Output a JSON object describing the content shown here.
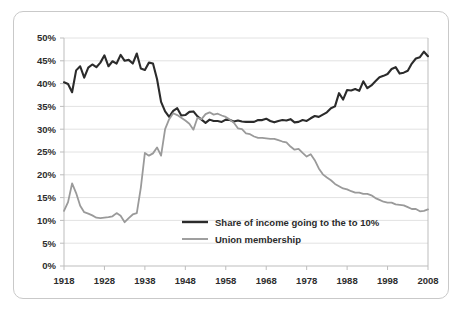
{
  "chart_data": {
    "type": "line",
    "title": "",
    "subtitle": "",
    "xlabel": "",
    "ylabel": "",
    "xlim": [
      1918,
      2008
    ],
    "ylim": [
      0,
      50
    ],
    "grid": true,
    "legend_position": "center",
    "x_ticks": [
      "1918",
      "1928",
      "1938",
      "1948",
      "1958",
      "1968",
      "1978",
      "1988",
      "1998",
      "2008"
    ],
    "x_tick_values": [
      1918,
      1928,
      1938,
      1948,
      1958,
      1968,
      1978,
      1988,
      1998,
      2008
    ],
    "y_ticks": [
      "0%",
      "5%",
      "10%",
      "15%",
      "20%",
      "25%",
      "30%",
      "35%",
      "40%",
      "45%",
      "50%"
    ],
    "y_tick_values": [
      0,
      5,
      10,
      15,
      20,
      25,
      30,
      35,
      40,
      45,
      50
    ],
    "x": [
      1918,
      1919,
      1920,
      1921,
      1922,
      1923,
      1924,
      1925,
      1926,
      1927,
      1928,
      1929,
      1930,
      1931,
      1932,
      1933,
      1934,
      1935,
      1936,
      1937,
      1938,
      1939,
      1940,
      1941,
      1942,
      1943,
      1944,
      1945,
      1946,
      1947,
      1948,
      1949,
      1950,
      1951,
      1952,
      1953,
      1954,
      1955,
      1956,
      1957,
      1958,
      1959,
      1960,
      1961,
      1962,
      1963,
      1964,
      1965,
      1966,
      1967,
      1968,
      1969,
      1970,
      1971,
      1972,
      1973,
      1974,
      1975,
      1976,
      1977,
      1978,
      1979,
      1980,
      1981,
      1982,
      1983,
      1984,
      1985,
      1986,
      1987,
      1988,
      1989,
      1990,
      1991,
      1992,
      1993,
      1994,
      1995,
      1996,
      1997,
      1998,
      1999,
      2000,
      2001,
      2002,
      2003,
      2004,
      2005,
      2006,
      2007,
      2008
    ],
    "series": [
      {
        "name": "Share of income going to the to 10%",
        "color": "#2b2b2b",
        "width": 2.1,
        "values": [
          40.3,
          39.9,
          38.1,
          42.9,
          43.8,
          41.3,
          43.5,
          44.2,
          43.6,
          44.6,
          46.2,
          43.8,
          44.9,
          44.4,
          46.3,
          45.0,
          45.2,
          44.4,
          46.6,
          43.3,
          43.0,
          44.6,
          44.4,
          41.0,
          36.0,
          33.9,
          32.7,
          34.0,
          34.6,
          33.0,
          33.1,
          33.8,
          33.9,
          32.8,
          32.1,
          31.4,
          32.1,
          31.8,
          31.8,
          31.6,
          32.1,
          32.0,
          31.7,
          31.9,
          31.7,
          31.6,
          31.6,
          31.6,
          32.0,
          32.0,
          32.3,
          31.8,
          31.5,
          31.8,
          32.0,
          31.9,
          32.2,
          31.5,
          31.6,
          32.0,
          31.8,
          32.4,
          32.9,
          32.7,
          33.2,
          33.7,
          34.6,
          35.0,
          37.9,
          36.5,
          38.6,
          38.5,
          38.8,
          38.4,
          40.5,
          39.0,
          39.6,
          40.5,
          41.4,
          41.7,
          42.1,
          43.2,
          43.6,
          42.2,
          42.4,
          42.8,
          44.4,
          45.5,
          45.8,
          47.0,
          46.0
        ]
      },
      {
        "name": "Union membership",
        "color": "#9a9a9a",
        "width": 1.8,
        "values": [
          12.1,
          14.0,
          18.1,
          16.0,
          13.2,
          11.8,
          11.5,
          11.1,
          10.6,
          10.5,
          10.6,
          10.7,
          10.9,
          11.6,
          11.0,
          9.6,
          10.5,
          11.3,
          11.6,
          17.2,
          24.8,
          24.2,
          24.7,
          26.0,
          24.2,
          30.0,
          32.2,
          33.5,
          33.1,
          32.5,
          31.9,
          31.2,
          29.9,
          32.5,
          32.2,
          33.3,
          33.7,
          33.2,
          33.4,
          33.0,
          32.7,
          32.1,
          31.4,
          30.2,
          30.0,
          29.1,
          28.9,
          28.4,
          28.1,
          28.1,
          28.0,
          27.9,
          27.9,
          27.6,
          27.3,
          27.1,
          26.2,
          25.5,
          25.7,
          24.8,
          24.0,
          24.5,
          23.2,
          21.4,
          20.1,
          19.4,
          18.8,
          18.0,
          17.5,
          17.0,
          16.8,
          16.4,
          16.1,
          16.1,
          15.8,
          15.8,
          15.5,
          14.9,
          14.5,
          14.1,
          13.9,
          13.9,
          13.5,
          13.4,
          13.3,
          12.9,
          12.5,
          12.5,
          12.0,
          12.1,
          12.4
        ]
      }
    ]
  },
  "legend": {
    "entries": [
      {
        "label": "Share of income going to the to 10%",
        "color": "#2b2b2b"
      },
      {
        "label": "Union membership",
        "color": "#9a9a9a"
      }
    ]
  }
}
